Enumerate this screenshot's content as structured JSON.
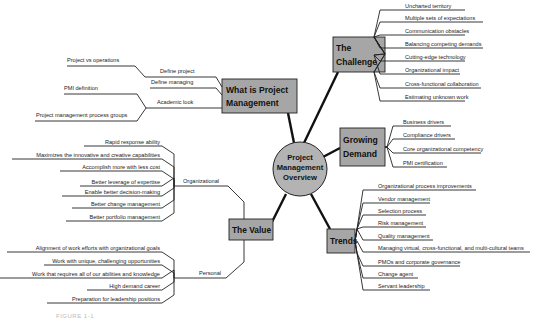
{
  "center": {
    "lines": [
      "Project",
      "Management",
      "Overview"
    ]
  },
  "branches": {
    "what": {
      "title_lines": [
        "What is Project",
        "Management"
      ],
      "subs": [
        {
          "label": "Define project",
          "children": [
            "Project vs operations"
          ]
        },
        {
          "label": "Define managing",
          "children": []
        },
        {
          "label": "Academic look",
          "children": [
            "PMI definition",
            "Project management process groups"
          ]
        }
      ]
    },
    "challenge": {
      "title_lines": [
        "The",
        "Challenge"
      ],
      "items": [
        "Uncharted territory",
        "Multiple sets of expectations",
        "Communication obstacles",
        "Balancing competing demands",
        "Cutting-edge technology",
        "Organizational impact",
        "Cross-functional collaboration",
        "Estimating unknown work"
      ]
    },
    "demand": {
      "title_lines": [
        "Growing",
        "Demand"
      ],
      "items": [
        "Business drivers",
        "Compliance drivers",
        "Core organizational competency",
        "PMI certification"
      ]
    },
    "trends": {
      "title_lines": [
        "Trends"
      ],
      "items": [
        "Organizational process improvements",
        "Vendor management",
        "Selection process",
        "Risk management",
        "Quality management",
        "Managing virtual, cross-functional, and multi-cultural teams",
        "PMOs and corporate governance",
        "Change agent",
        "Servant leadership"
      ]
    },
    "value": {
      "title_lines": [
        "The Value"
      ],
      "subs": [
        {
          "label": "Organizational",
          "children": [
            "Rapid response ability",
            "Maximizes the innovative and creative capabilities",
            "Accomplish more with less cost",
            "Better leverage of expertise",
            "Enable better decision-making",
            "Better change management",
            "Better portfolio management"
          ]
        },
        {
          "label": "Personal",
          "children": [
            "Alignment of work efforts with organizational goals",
            "Work with unique, challenging opportunities",
            "Work that requires all of our abilities and knowledge",
            "High demand career",
            "Preparation for leadership positions"
          ]
        }
      ]
    }
  },
  "caption": "FIGURE 1-1",
  "colors": {
    "box_fill": "#a6a6a6",
    "circle_fill": "#b3b3b3",
    "stroke": "#222222"
  }
}
